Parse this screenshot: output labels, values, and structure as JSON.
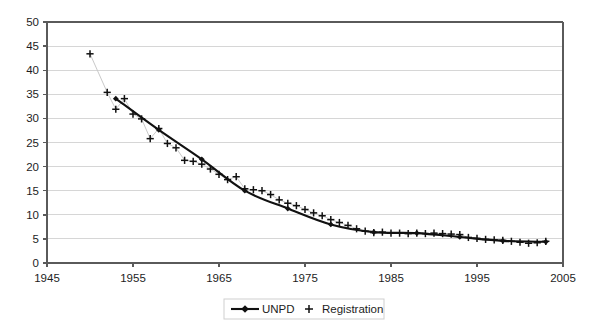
{
  "chart_data": {
    "type": "line",
    "title": "",
    "subtitle": "",
    "xlabel": "",
    "ylabel": "",
    "xlim": [
      1945,
      2005
    ],
    "ylim": [
      0,
      50
    ],
    "xticks": [
      1945,
      1955,
      1965,
      1975,
      1985,
      1995,
      2005
    ],
    "yticks": [
      0,
      5,
      10,
      15,
      20,
      25,
      30,
      35,
      40,
      45,
      50
    ],
    "grid": "horizontal",
    "legend_position": "bottom-center",
    "series": [
      {
        "name": "UNPD",
        "marker": "diamond",
        "line": "solid",
        "x": [
          1953,
          1958,
          1963,
          1968,
          1973,
          1978,
          1983,
          1988,
          1993,
          1998,
          2003
        ],
        "values": [
          34.1,
          27.6,
          21.5,
          15.0,
          11.3,
          8.0,
          6.4,
          6.2,
          5.4,
          4.6,
          4.4
        ]
      },
      {
        "name": "Registration",
        "marker": "plus",
        "line": "none",
        "x": [
          1950,
          1952,
          1953,
          1954,
          1955,
          1956,
          1957,
          1958,
          1959,
          1960,
          1961,
          1962,
          1963,
          1964,
          1965,
          1966,
          1967,
          1968,
          1969,
          1970,
          1971,
          1972,
          1973,
          1974,
          1975,
          1976,
          1977,
          1978,
          1979,
          1980,
          1981,
          1982,
          1983,
          1984,
          1985,
          1986,
          1987,
          1988,
          1989,
          1990,
          1991,
          1992,
          1993,
          1994,
          1995,
          1996,
          1997,
          1998,
          1999,
          2000,
          2001,
          2002,
          2003
        ],
        "values": [
          43.4,
          35.4,
          31.9,
          34.1,
          30.9,
          29.9,
          25.8,
          27.9,
          24.8,
          23.9,
          21.3,
          21.1,
          20.5,
          19.5,
          18.4,
          17.3,
          17.9,
          15.4,
          15.2,
          15.0,
          14.2,
          13.1,
          12.4,
          11.9,
          11.1,
          10.4,
          9.8,
          9.0,
          8.4,
          7.8,
          7.1,
          6.6,
          6.3,
          6.4,
          6.2,
          6.2,
          6.1,
          6.2,
          6.1,
          6.2,
          6.1,
          6.0,
          5.9,
          5.3,
          5.1,
          4.9,
          4.8,
          4.7,
          4.5,
          4.3,
          4.1,
          4.2,
          4.5
        ]
      }
    ],
    "legend": [
      {
        "label": "UNPD",
        "marker": "line-diamond"
      },
      {
        "label": "Registration",
        "marker": "plus"
      }
    ],
    "colors": {
      "series_line": "#111111",
      "marker": "#111111",
      "gridline": "#d6d6d6",
      "axis": "#5a5a5a",
      "background": "#ffffff"
    }
  }
}
